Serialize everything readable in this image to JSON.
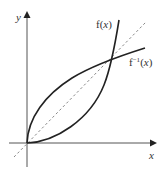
{
  "diagram": {
    "axes": {
      "x_label": "x",
      "y_label": "y"
    },
    "curves": [
      {
        "name": "f(x)",
        "label": "f(x)",
        "style": "solid"
      },
      {
        "name": "f_inverse",
        "label": "f⁻¹(x)",
        "style": "solid"
      },
      {
        "name": "y_equals_x",
        "label": "",
        "style": "dashed"
      }
    ],
    "labels": {
      "f": "f(",
      "f_x": "x",
      "f_close": ")",
      "finv": "f",
      "finv_sup": "−1",
      "finv_open": "(",
      "finv_x": "x",
      "finv_close": ")"
    },
    "colors": {
      "curve": "#222222",
      "axis": "#444444",
      "dashed": "#888888"
    }
  }
}
